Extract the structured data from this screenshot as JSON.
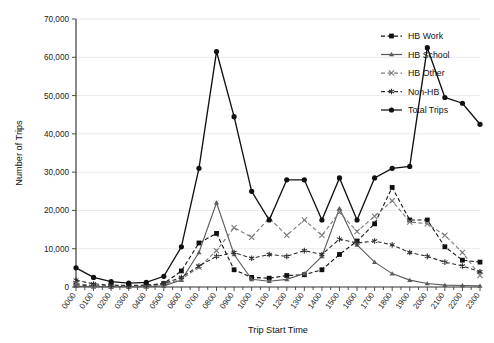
{
  "chart_data": {
    "type": "line",
    "title": "",
    "xlabel": "Trip Start Time",
    "ylabel": "Number of Trips",
    "ylim": [
      0,
      70000
    ],
    "ytick_labels": [
      "0",
      "10,000",
      "20,000",
      "30,000",
      "40,000",
      "50,000",
      "60,000",
      "70,000"
    ],
    "ytick_values": [
      0,
      10000,
      20000,
      30000,
      40000,
      50000,
      60000,
      70000
    ],
    "grid": true,
    "legend_position": "top-right",
    "categories": [
      "0000",
      "0100",
      "0200",
      "0300",
      "0400",
      "0500",
      "0600",
      "0700",
      "0800",
      "0900",
      "1000",
      "1100",
      "1200",
      "1300",
      "1400",
      "1500",
      "1600",
      "1700",
      "1800",
      "1900",
      "2000",
      "2100",
      "2200",
      "2300"
    ],
    "series": [
      {
        "name": "HB Work",
        "marker": "filled-square",
        "line": "dashed",
        "color": "#111111",
        "values": [
          600,
          300,
          200,
          200,
          300,
          900,
          4200,
          11500,
          14000,
          4500,
          2500,
          2300,
          3000,
          3200,
          4500,
          8500,
          12000,
          16500,
          26000,
          17500,
          17500,
          10500,
          7000,
          6500
        ]
      },
      {
        "name": "HB School",
        "marker": "small-triangle",
        "line": "solid",
        "color": "#5a5a5a",
        "values": [
          200,
          100,
          100,
          100,
          100,
          300,
          1800,
          9000,
          22000,
          8500,
          2000,
          1500,
          2000,
          3500,
          8000,
          20500,
          11000,
          6500,
          3500,
          1800,
          900,
          500,
          400,
          300
        ]
      },
      {
        "name": "HB Other",
        "marker": "cross-x",
        "line": "dashed",
        "color": "#7a7a7a",
        "values": [
          900,
          400,
          300,
          250,
          300,
          700,
          2000,
          5200,
          9500,
          15500,
          13000,
          18000,
          13500,
          17500,
          13500,
          19500,
          14500,
          18500,
          22500,
          17000,
          16500,
          13500,
          9000,
          3000
        ]
      },
      {
        "name": "Non-HB",
        "marker": "asterisk",
        "line": "dashed",
        "color": "#2e2e2e",
        "values": [
          1800,
          800,
          500,
          400,
          500,
          900,
          2500,
          5500,
          8000,
          9000,
          7500,
          8500,
          8000,
          9500,
          8500,
          12500,
          11500,
          12000,
          11000,
          9000,
          8000,
          6500,
          5500,
          4000
        ]
      },
      {
        "name": "Total Trips",
        "marker": "filled-circle",
        "line": "solid",
        "color": "#111111",
        "values": [
          5000,
          2500,
          1400,
          1000,
          1200,
          2800,
          10500,
          31000,
          61500,
          44500,
          25000,
          17500,
          28000,
          28000,
          17500,
          28500,
          17500,
          28500,
          31000,
          31500,
          62500,
          49500,
          48000,
          42500
        ]
      }
    ],
    "total_trips_full": [
      5000,
      2500,
      1400,
      1000,
      1200,
      2800,
      10500,
      31000,
      61500,
      44500,
      25000,
      17500,
      28000,
      28000,
      17500,
      28500,
      17500,
      28500,
      31000,
      31500,
      62500,
      49500,
      48000,
      42500
    ]
  },
  "legend": {
    "items": [
      {
        "label": "HB Work"
      },
      {
        "label": "HB School"
      },
      {
        "label": "HB Other"
      },
      {
        "label": "Non-HB"
      },
      {
        "label": "Total Trips"
      }
    ]
  },
  "axes": {
    "y_title": "Number of Trips",
    "x_title": "Trip Start Time"
  }
}
